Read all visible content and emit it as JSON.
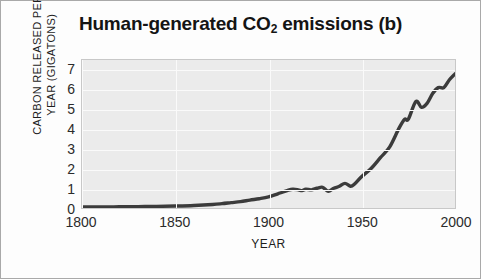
{
  "figure": {
    "title_main": "Human-generated CO",
    "title_sub": "2",
    "title_tail": " emissions (b)"
  },
  "colors": {
    "curve": "#3b3b3b",
    "plot_background": "#ebebeb",
    "gridline": "#fafafa",
    "frame_border": "#a9a9a9",
    "text": "#1e1e1e"
  },
  "chart_data": {
    "type": "line",
    "title": "Human-generated CO2 emissions (b)",
    "xlabel": "YEAR",
    "ylabel": "CARBON RELEASED PER YEAR (GIGATONS)",
    "xlim": [
      1800,
      2000
    ],
    "ylim": [
      0,
      7.5
    ],
    "xticks": [
      1800,
      1850,
      1900,
      1950,
      2000
    ],
    "yticks": [
      0,
      1,
      2,
      3,
      4,
      5,
      6,
      7
    ],
    "grid": true,
    "legend": "none",
    "series": [
      {
        "name": "Carbon released per year",
        "x": [
          1800,
          1810,
          1820,
          1830,
          1840,
          1850,
          1860,
          1870,
          1875,
          1880,
          1885,
          1890,
          1895,
          1900,
          1905,
          1910,
          1913,
          1916,
          1918,
          1920,
          1923,
          1926,
          1929,
          1932,
          1935,
          1938,
          1941,
          1944,
          1946,
          1950,
          1955,
          1960,
          1965,
          1970,
          1973,
          1975,
          1979,
          1982,
          1985,
          1988,
          1991,
          1994,
          1997,
          2000
        ],
        "y": [
          0.05,
          0.05,
          0.06,
          0.07,
          0.08,
          0.1,
          0.13,
          0.18,
          0.22,
          0.27,
          0.32,
          0.4,
          0.47,
          0.56,
          0.72,
          0.88,
          0.95,
          0.92,
          0.88,
          0.95,
          0.92,
          1.0,
          1.05,
          0.85,
          1.0,
          1.1,
          1.25,
          1.1,
          1.2,
          1.6,
          2.0,
          2.55,
          3.1,
          4.05,
          4.5,
          4.5,
          5.4,
          5.1,
          5.3,
          5.8,
          6.1,
          6.1,
          6.5,
          6.8
        ]
      }
    ],
    "annotations": [
      "Near-flat emissions 1800-1870",
      "Steady rise from 1870",
      "Dip during World War I (~1918)",
      "Dip during Great Depression (~1932)",
      "Dip at end of World War II (~1944)",
      "Rapid growth after 1950",
      "Plateau/dip around oil crises (1973-1982)",
      "Ends near 6.8 gigatons in 2000"
    ]
  },
  "axes": {
    "yticks": [
      "7",
      "6",
      "5",
      "4",
      "3",
      "2",
      "1",
      "0"
    ],
    "xticks": [
      "1800",
      "1850",
      "1900",
      "1950",
      "2000"
    ],
    "ylabel_line1": "CARBON RELEASED PER",
    "ylabel_line2": "YEAR (GIGATONS)",
    "xlabel": "YEAR"
  }
}
